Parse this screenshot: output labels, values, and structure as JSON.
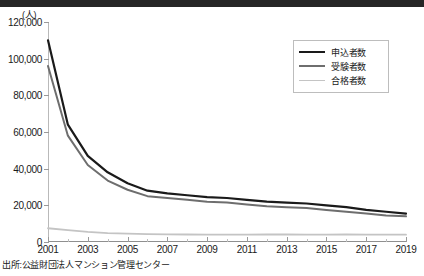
{
  "unit_label": "(人)",
  "source_note": "出所:公益財団法人マンション管理センター",
  "legend": {
    "position": "top-right",
    "items": [
      {
        "label": "申込者数",
        "color": "#1a1a1a",
        "width": 2.2
      },
      {
        "label": "受験者数",
        "color": "#6e6e6e",
        "width": 2.0
      },
      {
        "label": "合格者数",
        "color": "#c4c4c4",
        "width": 1.8
      }
    ]
  },
  "chart_data": {
    "type": "line",
    "title": "",
    "subtitle": "",
    "xlabel": "",
    "ylabel": "(人)",
    "grid": false,
    "legend_position": "top-right",
    "xlim": [
      2001,
      2019
    ],
    "ylim": [
      0,
      120000
    ],
    "yticks": [
      0,
      20000,
      40000,
      60000,
      80000,
      100000,
      120000
    ],
    "ytick_labels": [
      "0",
      "20,000",
      "40,000",
      "60,000",
      "80,000",
      "100,000",
      "120,000"
    ],
    "x": [
      2001,
      2002,
      2003,
      2004,
      2005,
      2006,
      2007,
      2008,
      2009,
      2010,
      2011,
      2012,
      2013,
      2014,
      2015,
      2016,
      2017,
      2018,
      2019
    ],
    "xticks": [
      2001,
      2003,
      2005,
      2007,
      2009,
      2011,
      2013,
      2015,
      2017,
      2019
    ],
    "xtick_labels": [
      "2001",
      "2003",
      "2005",
      "2007",
      "2009",
      "2011",
      "2013",
      "2015",
      "2017",
      "2019"
    ],
    "series": [
      {
        "name": "申込者数",
        "color": "#1a1a1a",
        "values": [
          110000,
          64000,
          47000,
          38000,
          32000,
          28000,
          26500,
          25500,
          24500,
          24000,
          23000,
          22000,
          21500,
          21000,
          20000,
          19000,
          17500,
          16500,
          15500
        ]
      },
      {
        "name": "受験者数",
        "color": "#6e6e6e",
        "values": [
          96000,
          58000,
          42000,
          33500,
          28500,
          25000,
          24000,
          23000,
          22000,
          21500,
          20500,
          19500,
          19000,
          18500,
          17500,
          16500,
          15500,
          14500,
          14000
        ]
      },
      {
        "name": "合格者数",
        "color": "#c4c4c4",
        "values": [
          7500,
          6500,
          5500,
          4800,
          4600,
          4300,
          4200,
          4100,
          4000,
          4000,
          4000,
          4100,
          4100,
          4000,
          4000,
          4100,
          4000,
          4000,
          4000
        ]
      }
    ]
  }
}
